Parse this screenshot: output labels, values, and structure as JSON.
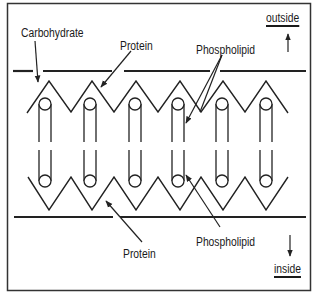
{
  "labels": {
    "carbohydrate": "Carbohydrate",
    "protein_top": "Protein",
    "phospholipid_top": "Phospholipid",
    "protein_bottom": "Protein",
    "phospholipid_bottom": "Phospholipid",
    "outside": "outside",
    "inside": "inside"
  },
  "colors": {
    "line": "#222222",
    "background": "#ffffff"
  },
  "structure": {
    "phospholipid_columns": 6,
    "top_zigzag_peaks": 6,
    "bottom_zigzag_valleys": 6,
    "direction_arrows": [
      "up-outside",
      "down-inside"
    ]
  }
}
